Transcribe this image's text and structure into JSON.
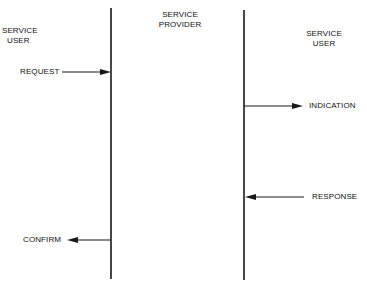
{
  "headers": {
    "left": [
      "SERVICE",
      "USER"
    ],
    "middle": [
      "SERVICE",
      "PROVIDER"
    ],
    "right": [
      "SERVICE",
      "USER"
    ]
  },
  "primitives": {
    "request": "REQUEST",
    "indication": "INDICATION",
    "response": "RESPONSE",
    "confirm": "CONFIRM"
  },
  "colors": {
    "line": "#1a1a1a",
    "background": "#ffffff"
  }
}
